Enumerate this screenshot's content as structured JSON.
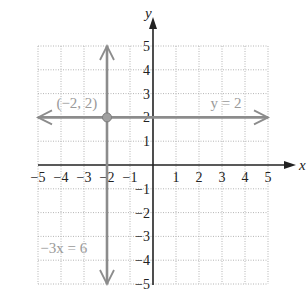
{
  "chart_data": {
    "type": "line",
    "title": "",
    "xlabel": "x",
    "ylabel": "y",
    "xlim": [
      -5,
      5
    ],
    "ylim": [
      -5,
      5
    ],
    "grid": true,
    "x_ticks": [
      -5,
      -4,
      -3,
      -2,
      -1,
      1,
      2,
      3,
      4,
      5
    ],
    "y_ticks": [
      5,
      4,
      3,
      2,
      1,
      -1,
      -2,
      -3,
      -4,
      -5
    ],
    "x_tick_labels": [
      "−5",
      "−4",
      "−3",
      "−2",
      "−1",
      "1",
      "2",
      "3",
      "4",
      "5"
    ],
    "y_tick_labels": [
      "5",
      "4",
      "3",
      "2",
      "1",
      "−1",
      "−2",
      "−3",
      "−4",
      "−5"
    ],
    "series": [
      {
        "name": "y = 2",
        "kind": "horizontal-line",
        "y": 2,
        "x": [
          -5,
          5
        ],
        "color": "#8c8c8c"
      },
      {
        "name": "−3x = 6",
        "kind": "vertical-line",
        "x": -2,
        "y": [
          -5,
          5
        ],
        "color": "#8c8c8c"
      }
    ],
    "points": [
      {
        "label": "(−2, 2)",
        "x": -2,
        "y": 2
      }
    ],
    "annotations": [
      {
        "text": "(−2, 2)",
        "x": -4.2,
        "y": 2.4
      },
      {
        "text": "y = 2",
        "x": 2.5,
        "y": 2.4
      },
      {
        "text": "−3x = 6",
        "x": -4.9,
        "y": -3.7
      }
    ]
  }
}
